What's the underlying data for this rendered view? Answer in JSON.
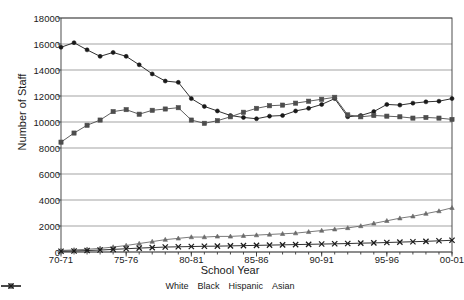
{
  "chart_data": {
    "type": "line",
    "title": "",
    "xlabel": "School Year",
    "ylabel": "Number of Staff",
    "ylim": [
      0,
      18000
    ],
    "ytick_step": 2000,
    "yticks": [
      "0",
      "2000",
      "4000",
      "6000",
      "8000",
      "10000",
      "12000",
      "14000",
      "16000",
      "18000"
    ],
    "grid": "horizontal",
    "legend_position": "bottom",
    "x": [
      "70-71",
      "71-72",
      "72-73",
      "73-74",
      "74-75",
      "75-76",
      "76-77",
      "77-78",
      "78-79",
      "79-80",
      "80-81",
      "81-82",
      "82-83",
      "83-84",
      "84-85",
      "85-86",
      "86-87",
      "87-88",
      "88-89",
      "89-90",
      "90-91",
      "91-92",
      "92-93",
      "93-94",
      "94-95",
      "95-96",
      "96-97",
      "97-98",
      "98-99",
      "99-00",
      "00-01"
    ],
    "xtick_labels": [
      "70-71",
      "75-76",
      "80-81",
      "85-86",
      "90-91",
      "95-96",
      "00-01"
    ],
    "xtick_indices": [
      0,
      5,
      10,
      15,
      20,
      25,
      30
    ],
    "series": [
      {
        "name": "White",
        "marker": "circle",
        "color": "#1a1a1a",
        "values": [
          15750,
          16100,
          15550,
          15050,
          15350,
          15050,
          14400,
          13700,
          13150,
          13050,
          11800,
          11200,
          10850,
          10500,
          10350,
          10250,
          10450,
          10500,
          10850,
          11050,
          11350,
          11800,
          10400,
          10500,
          10800,
          11350,
          11300,
          11450,
          11550,
          11600,
          11800
        ]
      },
      {
        "name": "Black",
        "marker": "square",
        "color": "#4d4d4d",
        "values": [
          8450,
          9150,
          9750,
          10150,
          10800,
          10950,
          10600,
          10900,
          11000,
          11100,
          10150,
          9900,
          10100,
          10400,
          10750,
          11050,
          11250,
          11300,
          11450,
          11600,
          11750,
          11900,
          10550,
          10400,
          10500,
          10450,
          10400,
          10300,
          10350,
          10300,
          10200
        ]
      },
      {
        "name": "Hispanic",
        "marker": "triangle",
        "color": "#6b6b6b",
        "values": [
          120,
          160,
          210,
          280,
          380,
          500,
          650,
          800,
          950,
          1050,
          1150,
          1150,
          1200,
          1200,
          1250,
          1300,
          1350,
          1400,
          1450,
          1550,
          1650,
          1750,
          1850,
          2000,
          2200,
          2400,
          2600,
          2750,
          2950,
          3150,
          3400
        ]
      },
      {
        "name": "Asian",
        "marker": "cross",
        "color": "#1a1a1a",
        "values": [
          60,
          80,
          110,
          150,
          200,
          250,
          300,
          340,
          380,
          400,
          420,
          440,
          450,
          470,
          490,
          510,
          530,
          550,
          570,
          590,
          610,
          630,
          650,
          680,
          700,
          730,
          760,
          790,
          820,
          860,
          900
        ]
      }
    ]
  }
}
